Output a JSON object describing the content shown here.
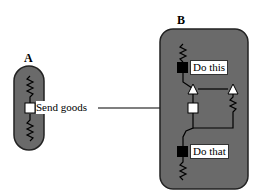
{
  "diagram": {
    "panel_a": {
      "label": "A",
      "node": {
        "type": "open-square",
        "label": "Send goods"
      }
    },
    "panel_b": {
      "label": "B",
      "nodes": [
        {
          "type": "filled-square",
          "label": "Do this"
        },
        {
          "type": "filled-square",
          "label": "Do that"
        },
        {
          "type": "open-square",
          "label": ""
        },
        {
          "type": "open-triangle",
          "label": ""
        },
        {
          "type": "open-triangle",
          "label": ""
        }
      ]
    },
    "colors": {
      "panel_fill": "#6a6a6a",
      "line": "#000000",
      "node_open": "#ffffff",
      "node_filled": "#000000"
    }
  }
}
